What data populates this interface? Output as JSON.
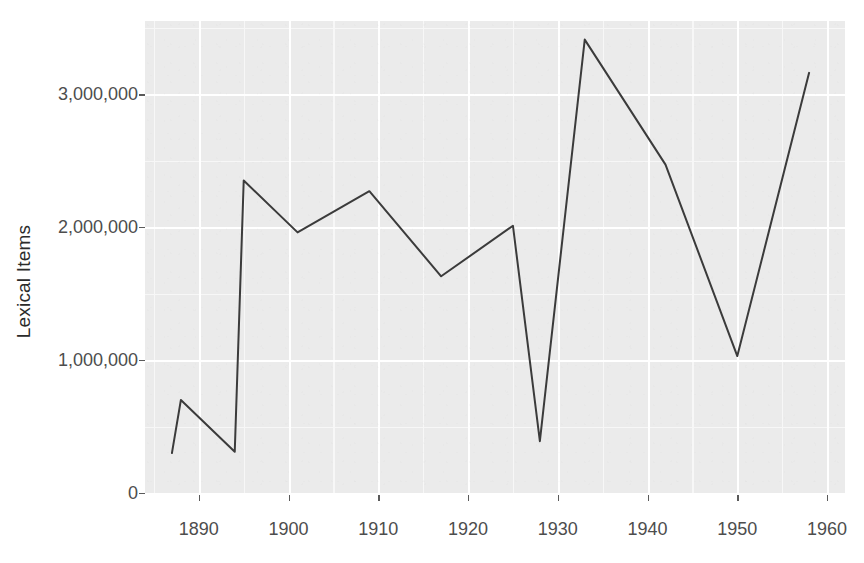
{
  "chart_data": {
    "type": "line",
    "title": "",
    "subtitle": "",
    "xlabel": "",
    "ylabel": "Lexical Items",
    "xlim": [
      1884,
      1962
    ],
    "ylim": [
      0,
      3550000
    ],
    "x_ticks": [
      1890,
      1900,
      1910,
      1920,
      1930,
      1940,
      1950,
      1960
    ],
    "x_tick_labels": [
      "1890",
      "1900",
      "1910",
      "1920",
      "1930",
      "1940",
      "1950",
      "1960"
    ],
    "y_ticks": [
      0,
      1000000,
      2000000,
      3000000
    ],
    "y_tick_labels": [
      "0",
      "1,000,000",
      "2,000,000",
      "3,000,000"
    ],
    "grid": true,
    "grid_major_color": "#ffffff",
    "grid_minor_color": "#f7f7f7",
    "panel_background": "#ebebeb",
    "line_color": "#3b3b3b",
    "line_width": 2,
    "legend": "none",
    "x": [
      1887,
      1888,
      1894,
      1895,
      1901,
      1909,
      1917,
      1925,
      1928,
      1933,
      1942,
      1950,
      1958
    ],
    "values": [
      300000,
      700000,
      310000,
      2350000,
      1960000,
      2270000,
      1630000,
      2010000,
      390000,
      3410000,
      2470000,
      1030000,
      3160000
    ],
    "series": [
      {
        "name": "Lexical Items",
        "points": [
          {
            "x": 1887,
            "y": 300000
          },
          {
            "x": 1888,
            "y": 700000
          },
          {
            "x": 1894,
            "y": 310000
          },
          {
            "x": 1895,
            "y": 2350000
          },
          {
            "x": 1901,
            "y": 1960000
          },
          {
            "x": 1909,
            "y": 2270000
          },
          {
            "x": 1917,
            "y": 1630000
          },
          {
            "x": 1925,
            "y": 2010000
          },
          {
            "x": 1928,
            "y": 390000
          },
          {
            "x": 1933,
            "y": 3410000
          },
          {
            "x": 1942,
            "y": 2470000
          },
          {
            "x": 1950,
            "y": 1030000
          },
          {
            "x": 1958,
            "y": 3160000
          }
        ]
      }
    ]
  }
}
